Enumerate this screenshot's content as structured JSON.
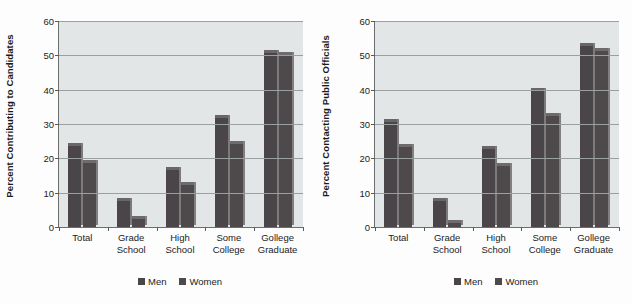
{
  "figure": {
    "background_color": "#ffffff",
    "panel_background_color": "#e3e6e6",
    "men_color": "#4a4548",
    "women_color": "#4e4a4c"
  },
  "legend": {
    "men_label": "Men",
    "women_label": "Women"
  },
  "chart_data": [
    {
      "type": "bar",
      "title": "",
      "ylabel": "Percent Contributing to Candidates",
      "xlabel": "",
      "ylim": [
        0,
        60
      ],
      "yticks": [
        0,
        10,
        20,
        30,
        40,
        50,
        60
      ],
      "ytick_labels": [
        "0",
        "10",
        "20",
        "30",
        "40",
        "50",
        "60"
      ],
      "grid": true,
      "legend_position": "bottom-center",
      "categories": [
        "Total",
        "Grade School",
        "High School",
        "Some College",
        "Gollege Graduate"
      ],
      "category_lines": [
        [
          "Total",
          ""
        ],
        [
          "Grade",
          "School"
        ],
        [
          "High",
          "School"
        ],
        [
          "Some",
          "College"
        ],
        [
          "Gollege",
          "Graduate"
        ]
      ],
      "series": [
        {
          "name": "Men",
          "values": [
            24,
            8,
            17,
            32,
            51
          ]
        },
        {
          "name": "Women",
          "values": [
            19,
            2.5,
            12.5,
            24.5,
            50.5
          ]
        }
      ]
    },
    {
      "type": "bar",
      "title": "",
      "ylabel": "Percent Contacting Public Officials",
      "xlabel": "",
      "ylim": [
        0,
        60
      ],
      "yticks": [
        0,
        10,
        20,
        30,
        40,
        50,
        60
      ],
      "ytick_labels": [
        "0",
        "10",
        "20",
        "30",
        "40",
        "50",
        "60"
      ],
      "grid": true,
      "legend_position": "bottom-center",
      "categories": [
        "Total",
        "Grade School",
        "High School",
        "Some College",
        "Gollege Graduate"
      ],
      "category_lines": [
        [
          "Total",
          ""
        ],
        [
          "Grade",
          "School"
        ],
        [
          "High",
          "School"
        ],
        [
          "Some",
          "College"
        ],
        [
          "Gollege",
          "Graduate"
        ]
      ],
      "series": [
        {
          "name": "Men",
          "values": [
            31,
            8,
            23,
            40,
            53
          ]
        },
        {
          "name": "Women",
          "values": [
            23.5,
            1.5,
            18,
            32.5,
            51.5
          ]
        }
      ]
    }
  ]
}
